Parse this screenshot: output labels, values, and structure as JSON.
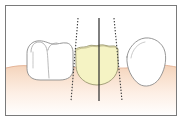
{
  "figure": {
    "title": "Tooth width mesiodistal measurement diagram",
    "caption": "",
    "type": "anatomical-line-diagram",
    "canvas": {
      "width": 182,
      "height": 121
    },
    "background_color": "#ffffff"
  },
  "frame": {
    "name": "figure-border",
    "stroke_color": "#7a7a7a",
    "stroke_width": 1,
    "inset": {
      "x": 5,
      "y": 5,
      "width": 172,
      "height": 111
    },
    "fill_color": "#ffffff"
  },
  "gingiva": {
    "label": "gum tissue",
    "color_top": "#f6d9c4",
    "color_mid": "#fbe7d8",
    "color_bottom": "#ffffff",
    "outline_color": "#e0a98a",
    "crest_y": 66,
    "band_height": 26
  },
  "teeth": [
    {
      "id": "left-tooth",
      "label": "Adjacent posterior tooth (left)",
      "fill_color": "#ffffff",
      "outline_color": "#8c8c8c",
      "highlighted": false,
      "cusp_count": 2,
      "notes": "cusp outlines and developmental groove visible"
    },
    {
      "id": "center-tooth",
      "label": "Measured tooth (highlighted)",
      "fill_color": "#f5f3c4",
      "outline_color": "#9a9670",
      "highlighted": true,
      "incisal_edge": "scalloped",
      "notes": "crown shaded yellow, bounded by dotted contact lines"
    },
    {
      "id": "right-tooth",
      "label": "Adjacent tooth (right, tilted)",
      "fill_color": "#ffffff",
      "outline_color": "#8c8c8c",
      "highlighted": false,
      "notes": "rounded peaked crown, mesially inclined"
    }
  ],
  "reference_lines": [
    {
      "id": "contact-line-mesial",
      "label": "Mesial contact point reference",
      "style": "dotted",
      "color": "#3a3a3a",
      "x_top": 78,
      "x_bottom": 71,
      "y_start": 18,
      "y_end": 101
    },
    {
      "id": "midline-axis",
      "label": "Long axis / midline",
      "style": "solid",
      "color": "#2b2b2b",
      "x_top": 99,
      "x_bottom": 99,
      "y_start": 18,
      "y_end": 101
    },
    {
      "id": "contact-line-distal",
      "label": "Distal contact point reference",
      "style": "dotted",
      "color": "#3a3a3a",
      "x_top": 114,
      "x_bottom": 122,
      "y_start": 18,
      "y_end": 101
    }
  ],
  "annotations": []
}
